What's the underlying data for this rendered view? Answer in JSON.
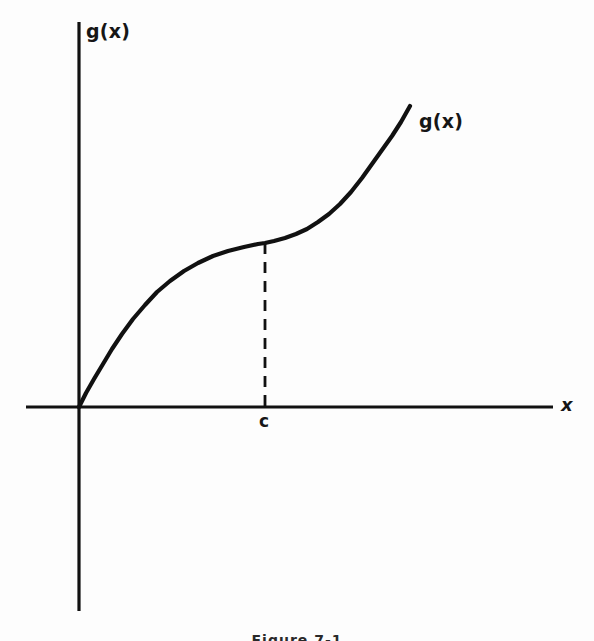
{
  "figure": {
    "caption": "Figure 7-1",
    "background_color": "#fdfdfd",
    "ink_color": "#111111"
  },
  "labels": {
    "y_axis": "g(x)",
    "x_axis": "x",
    "curve": "g(x)",
    "point_c": "c"
  },
  "chart_data": {
    "type": "line",
    "title": "",
    "subtitle": "",
    "xlabel": "x",
    "ylabel": "g(x)",
    "grid": false,
    "legend_position": "inline-right-of-curve",
    "annotations": [
      {
        "name": "curve-label",
        "text": "g(x)",
        "x_px": 419,
        "y_px": 110,
        "description": "label attached to the upper right end of the curve"
      },
      {
        "name": "c-tick-label",
        "text": "c",
        "x_px": 265,
        "y_px": 420,
        "description": "label on the x-axis marking the abscissa c"
      },
      {
        "name": "dashed-ordinate",
        "text": "",
        "description": "vertical dashed segment from the x-axis at x = c up to the curve point (c, g(c))",
        "x_px": 265,
        "y_from_px": 407,
        "y_to_px": 243,
        "style": "dashed"
      }
    ],
    "axes": {
      "x_axis_px": {
        "y": 407,
        "x_start": 26,
        "x_end": 553
      },
      "y_axis_px": {
        "x": 79,
        "y_start": 22,
        "y_end": 611
      },
      "origin_px": {
        "x": 79,
        "y": 407
      }
    },
    "series": [
      {
        "name": "g(x)",
        "description": "Smooth increasing curve from the origin; concave down until the inflection point at x = c, then concave up.",
        "inflection_point_px": {
          "x": 265,
          "y": 243
        },
        "points_px": [
          [
            79,
            407
          ],
          [
            86,
            393
          ],
          [
            94,
            379
          ],
          [
            103,
            364
          ],
          [
            112,
            349
          ],
          [
            122,
            334
          ],
          [
            133,
            319
          ],
          [
            145,
            305
          ],
          [
            157,
            292
          ],
          [
            170,
            281
          ],
          [
            184,
            271
          ],
          [
            198,
            263
          ],
          [
            213,
            256
          ],
          [
            228,
            251
          ],
          [
            244,
            247
          ],
          [
            258,
            244
          ],
          [
            265,
            243
          ],
          [
            274,
            241
          ],
          [
            285,
            238
          ],
          [
            296,
            234
          ],
          [
            307,
            229
          ],
          [
            318,
            222
          ],
          [
            329,
            214
          ],
          [
            340,
            204
          ],
          [
            351,
            192
          ],
          [
            362,
            178
          ],
          [
            372,
            164
          ],
          [
            382,
            150
          ],
          [
            392,
            136
          ],
          [
            401,
            122
          ],
          [
            410,
            106
          ]
        ]
      }
    ]
  }
}
